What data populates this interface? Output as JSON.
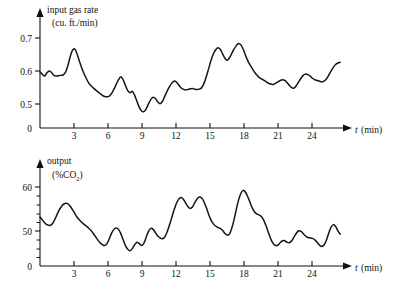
{
  "figure": {
    "background_color": "#ffffff",
    "line_color": "#141414",
    "axis_color": "#111111"
  },
  "panels": {
    "top": {
      "title_line1": "input gas rate",
      "title_line2": "(cu. ft./min)",
      "y_ticks": [
        "0.7",
        "0.6",
        "0.5",
        "0"
      ],
      "x_ticks": [
        "3",
        "6",
        "9",
        "12",
        "15",
        "18",
        "21",
        "24"
      ],
      "x_axis_symbol": "t",
      "x_axis_unit": "(min)"
    },
    "bottom": {
      "title_line1": "output",
      "title_line2_prefix": "(%CO",
      "title_line2_sub": "2",
      "title_line2_suffix": ")",
      "y_ticks": [
        "60",
        "50",
        "0"
      ],
      "x_ticks": [
        "3",
        "6",
        "9",
        "12",
        "15",
        "18",
        "21",
        "24"
      ],
      "x_axis_symbol": "t",
      "x_axis_unit": "(min)"
    }
  },
  "chart_data": [
    {
      "type": "line",
      "title": "input gas rate (cu. ft./min)",
      "xlabel": "t (min)",
      "ylabel": "input gas rate (cu. ft./min)",
      "xlim": [
        0,
        26.5
      ],
      "ylim": [
        0.455,
        0.725
      ],
      "ytick_values": [
        0.5,
        0.6,
        0.7
      ],
      "xtick_values": [
        3,
        6,
        9,
        12,
        15,
        18,
        21,
        24
      ],
      "grid": false,
      "legend": "none",
      "x": [
        0.0,
        0.2,
        0.4,
        0.6,
        0.8,
        1.0,
        1.2,
        1.4,
        1.6,
        1.8,
        2.0,
        2.2,
        2.4,
        2.6,
        2.8,
        3.0,
        3.2,
        3.4,
        3.6,
        3.8,
        4.0,
        4.2,
        4.4,
        4.6,
        4.8,
        5.0,
        5.2,
        5.4,
        5.6,
        5.8,
        6.0,
        6.2,
        6.4,
        6.6,
        6.8,
        7.0,
        7.2,
        7.4,
        7.6,
        7.8,
        8.0,
        8.2,
        8.4,
        8.6,
        8.8,
        9.0,
        9.2,
        9.4,
        9.6,
        9.8,
        10.0,
        10.2,
        10.4,
        10.6,
        10.8,
        11.0,
        11.2,
        11.4,
        11.6,
        11.8,
        12.0,
        12.2,
        12.4,
        12.6,
        12.8,
        13.0,
        13.2,
        13.4,
        13.6,
        13.8,
        14.0,
        14.2,
        14.4,
        14.6,
        14.8,
        15.0,
        15.2,
        15.4,
        15.6,
        15.8,
        16.0,
        16.2,
        16.4,
        16.6,
        16.8,
        17.0,
        17.2,
        17.4,
        17.6,
        17.8,
        18.0,
        18.2,
        18.4,
        18.6,
        18.8,
        19.0,
        19.2,
        19.4,
        19.6,
        19.8,
        20.0,
        20.2,
        20.4,
        20.6,
        20.8,
        21.0,
        21.2,
        21.4,
        21.6,
        21.8,
        22.0,
        22.2,
        22.4,
        22.6,
        22.8,
        23.0,
        23.2,
        23.4,
        23.6,
        23.8,
        24.0,
        24.2,
        24.4,
        24.6,
        24.8,
        25.0,
        25.2,
        25.4,
        25.6,
        25.8,
        26.0
      ],
      "y": [
        0.61,
        0.603,
        0.598,
        0.607,
        0.612,
        0.608,
        0.6,
        0.598,
        0.599,
        0.6,
        0.601,
        0.608,
        0.625,
        0.65,
        0.668,
        0.673,
        0.66,
        0.64,
        0.622,
        0.606,
        0.592,
        0.58,
        0.572,
        0.566,
        0.56,
        0.555,
        0.55,
        0.545,
        0.542,
        0.541,
        0.543,
        0.55,
        0.562,
        0.575,
        0.588,
        0.596,
        0.588,
        0.572,
        0.558,
        0.552,
        0.556,
        0.545,
        0.528,
        0.512,
        0.502,
        0.5,
        0.508,
        0.522,
        0.534,
        0.54,
        0.536,
        0.527,
        0.522,
        0.528,
        0.542,
        0.556,
        0.568,
        0.578,
        0.584,
        0.582,
        0.574,
        0.566,
        0.562,
        0.56,
        0.561,
        0.563,
        0.564,
        0.562,
        0.561,
        0.562,
        0.566,
        0.578,
        0.596,
        0.618,
        0.64,
        0.658,
        0.67,
        0.676,
        0.672,
        0.66,
        0.648,
        0.642,
        0.648,
        0.66,
        0.672,
        0.682,
        0.688,
        0.684,
        0.672,
        0.655,
        0.64,
        0.628,
        0.618,
        0.608,
        0.6,
        0.594,
        0.59,
        0.586,
        0.582,
        0.578,
        0.576,
        0.575,
        0.578,
        0.582,
        0.586,
        0.588,
        0.586,
        0.58,
        0.572,
        0.566,
        0.565,
        0.572,
        0.582,
        0.592,
        0.6,
        0.604,
        0.602,
        0.598,
        0.592,
        0.588,
        0.586,
        0.584,
        0.582,
        0.584,
        0.59,
        0.6,
        0.612,
        0.622,
        0.63,
        0.634,
        0.636
      ]
    },
    {
      "type": "line",
      "title": "output (%CO2)",
      "xlabel": "t (min)",
      "ylabel": "output (%CO2)",
      "xlim": [
        0,
        26.5
      ],
      "ylim": [
        43.5,
        62.0
      ],
      "ytick_values": [
        50,
        60
      ],
      "xtick_values": [
        3,
        6,
        9,
        12,
        15,
        18,
        21,
        24
      ],
      "grid": false,
      "legend": "none",
      "x": [
        0.0,
        0.2,
        0.4,
        0.6,
        0.8,
        1.0,
        1.2,
        1.4,
        1.6,
        1.8,
        2.0,
        2.2,
        2.4,
        2.6,
        2.8,
        3.0,
        3.2,
        3.4,
        3.6,
        3.8,
        4.0,
        4.2,
        4.4,
        4.6,
        4.8,
        5.0,
        5.2,
        5.4,
        5.6,
        5.8,
        6.0,
        6.2,
        6.4,
        6.6,
        6.8,
        7.0,
        7.2,
        7.4,
        7.6,
        7.8,
        8.0,
        8.2,
        8.4,
        8.6,
        8.8,
        9.0,
        9.2,
        9.4,
        9.6,
        9.8,
        10.0,
        10.2,
        10.4,
        10.6,
        10.8,
        11.0,
        11.2,
        11.4,
        11.6,
        11.8,
        12.0,
        12.2,
        12.4,
        12.6,
        12.8,
        13.0,
        13.2,
        13.4,
        13.6,
        13.8,
        14.0,
        14.2,
        14.4,
        14.6,
        14.8,
        15.0,
        15.2,
        15.4,
        15.6,
        15.8,
        16.0,
        16.2,
        16.4,
        16.6,
        16.8,
        17.0,
        17.2,
        17.4,
        17.6,
        17.8,
        18.0,
        18.2,
        18.4,
        18.6,
        18.8,
        19.0,
        19.2,
        19.4,
        19.6,
        19.8,
        20.0,
        20.2,
        20.4,
        20.6,
        20.8,
        21.0,
        21.2,
        21.4,
        21.6,
        21.8,
        22.0,
        22.2,
        22.4,
        22.6,
        22.8,
        23.0,
        23.2,
        23.4,
        23.6,
        23.8,
        24.0,
        24.2,
        24.4,
        24.6,
        24.8,
        25.0,
        25.2,
        25.4,
        25.6,
        25.8,
        26.0
      ],
      "y": [
        53.8,
        53.2,
        52.6,
        52.2,
        52.0,
        52.2,
        52.9,
        53.9,
        55.0,
        55.8,
        56.4,
        56.7,
        56.6,
        56.1,
        55.4,
        54.6,
        53.8,
        53.2,
        52.7,
        52.3,
        51.9,
        51.5,
        51.0,
        50.4,
        49.7,
        49.0,
        48.4,
        48.0,
        47.8,
        48.2,
        49.2,
        50.4,
        51.2,
        51.5,
        51.2,
        50.3,
        49.0,
        47.8,
        47.0,
        46.7,
        47.2,
        48.0,
        48.5,
        48.2,
        47.8,
        48.3,
        49.6,
        50.8,
        51.4,
        51.2,
        50.5,
        49.8,
        49.4,
        49.2,
        49.6,
        50.6,
        52.0,
        53.6,
        55.2,
        56.6,
        57.5,
        57.9,
        57.6,
        56.8,
        56.0,
        55.6,
        55.9,
        56.8,
        57.6,
        58.0,
        57.8,
        57.0,
        55.8,
        54.4,
        53.2,
        52.4,
        51.9,
        51.6,
        51.4,
        51.0,
        50.4,
        50.0,
        50.2,
        51.4,
        53.2,
        55.4,
        57.4,
        58.8,
        59.4,
        59.0,
        58.0,
        56.8,
        55.6,
        54.8,
        54.4,
        54.2,
        53.8,
        53.0,
        51.8,
        50.4,
        49.1,
        48.2,
        47.8,
        47.9,
        48.4,
        48.8,
        48.8,
        48.5,
        48.4,
        48.8,
        49.6,
        50.4,
        50.9,
        50.8,
        50.3,
        49.8,
        49.5,
        49.4,
        49.3,
        49.0,
        48.5,
        47.9,
        47.6,
        47.9,
        48.9,
        50.4,
        51.6,
        52.2,
        51.8,
        50.9,
        50.2
      ]
    }
  ]
}
